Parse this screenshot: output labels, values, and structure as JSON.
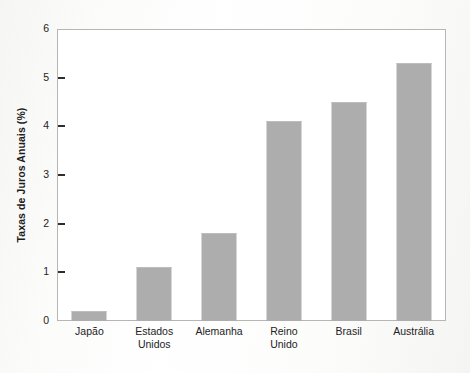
{
  "chart_data": {
    "type": "bar",
    "title": "",
    "subtitle": "",
    "xlabel": "",
    "ylabel": "Taxas de Juros Anuais (%)",
    "categories": [
      "Japão",
      "Estados Unidos",
      "Alemanha",
      "Reino Unido",
      "Brasil",
      "Austrália"
    ],
    "category_lines": [
      [
        "Japão"
      ],
      [
        "Estados",
        "Unidos"
      ],
      [
        "Alemanha"
      ],
      [
        "Reino",
        "Unido"
      ],
      [
        "Brasil"
      ],
      [
        "Austrália"
      ]
    ],
    "values": [
      0.2,
      1.1,
      1.8,
      4.1,
      4.5,
      5.3
    ],
    "ylim": [
      0,
      6
    ],
    "ytick_labels": [
      "0",
      "1",
      "2",
      "3",
      "4",
      "5",
      "6"
    ],
    "ytick_values": [
      0,
      1,
      2,
      3,
      4,
      5,
      6
    ],
    "grid": false,
    "legend": null,
    "legend_position": "none",
    "bar_color": "#adadad",
    "axis_color": "#b6b6b6",
    "text_color": "#232323",
    "background_color": "#ffffff"
  }
}
